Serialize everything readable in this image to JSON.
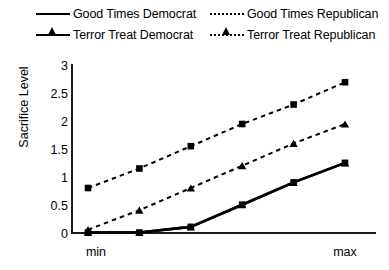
{
  "legend": {
    "rows": [
      {
        "left": {
          "label": "Good Times Democrat",
          "style": "solid",
          "marker": "triangle"
        },
        "right": {
          "label": "Good Times Republican",
          "style": "dashed",
          "marker": "triangle"
        }
      },
      {
        "left": {
          "label": "Terror Treat Democrat",
          "style": "solid",
          "marker": "square"
        },
        "right": {
          "label": "Terror Treat Republican",
          "style": "dashed",
          "marker": "square"
        }
      }
    ]
  },
  "axes": {
    "ylabel": "Sacrifice Level",
    "yticks": [
      "3",
      "2.5",
      "2",
      "1.5",
      "1",
      "0.5",
      "0"
    ],
    "xticks": [
      "min",
      "max"
    ]
  },
  "chart_data": {
    "type": "line",
    "title": "",
    "xlabel": "",
    "ylabel": "Sacrifice Level",
    "ylim": [
      0,
      3
    ],
    "ytick_values": [
      0,
      0.5,
      1,
      1.5,
      2,
      2.5,
      3
    ],
    "xtick_labels": [
      "min",
      "max"
    ],
    "x": [
      1,
      2,
      3,
      4,
      5,
      6
    ],
    "x_axis_note": "categorical axis from min to max, 6 evenly spaced points; only endpoints labelled",
    "grid": false,
    "legend_position": "top",
    "series": [
      {
        "name": "Good Times Democrat",
        "style": "solid",
        "marker": "triangle",
        "color": "#000000",
        "values": [
          0,
          0,
          0.1,
          0.5,
          0.9,
          1.25
        ]
      },
      {
        "name": "Terror Treat Democrat",
        "style": "solid",
        "marker": "square",
        "color": "#000000",
        "values": [
          0,
          0,
          0.1,
          0.5,
          0.9,
          1.25
        ]
      },
      {
        "name": "Good Times Republican",
        "style": "dashed",
        "marker": "triangle",
        "color": "#000000",
        "values": [
          0.05,
          0.4,
          0.8,
          1.2,
          1.6,
          1.95
        ]
      },
      {
        "name": "Terror Treat Republican",
        "style": "dashed",
        "marker": "square",
        "color": "#000000",
        "values": [
          0.8,
          1.15,
          1.55,
          1.95,
          2.3,
          2.7
        ]
      }
    ],
    "annotations": [
      "Democrat series (solid triangle and solid square) overlap and are flat at 0 from min through the second point, then rise nearly linearly to ~1.25 at max.",
      "Republican series are both dashed and rise nearly linearly across the whole range."
    ]
  }
}
